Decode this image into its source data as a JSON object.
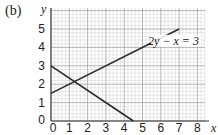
{
  "figure": {
    "part_label": "(b)"
  },
  "chart_data": {
    "type": "line",
    "title": "",
    "xlabel": "x",
    "ylabel": "y",
    "xlim": [
      0,
      8.5
    ],
    "ylim": [
      0,
      6
    ],
    "x_ticks": [
      "0",
      "1",
      "2",
      "3",
      "4",
      "5",
      "6",
      "7",
      "8"
    ],
    "y_ticks": [
      "0",
      "1",
      "2",
      "3",
      "4",
      "5"
    ],
    "grid": true,
    "grid_minor_step": 0.2,
    "series": [
      {
        "name": "2y − x = 3",
        "label": "2y − x = 3",
        "points": [
          [
            0,
            1.5
          ],
          [
            7,
            5
          ]
        ]
      },
      {
        "name": "decreasing line",
        "label": "",
        "points": [
          [
            0,
            3
          ],
          [
            4.5,
            0
          ]
        ]
      }
    ],
    "annotations": [
      {
        "text": "2y − x = 3",
        "x": 7.1,
        "y": 4.2
      }
    ]
  },
  "colors": {
    "grid_minor": "#c8c8c8",
    "grid_major": "#9a9a9a",
    "axis": "#333333",
    "line": "#2a2a2a",
    "text": "#222222"
  }
}
